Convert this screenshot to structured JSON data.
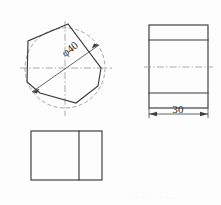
{
  "sheet": {
    "width": 221,
    "height": 205,
    "background": "#fdfdfd",
    "line_color": "#3a3a3a",
    "construction_color": "#8f8f8f"
  },
  "views": {
    "front_view": {
      "name": "front-view-polygon",
      "description": "heptagon inscribed in dashed construction circle",
      "center_x": 65,
      "center_y": 68,
      "circle_radius": 40,
      "polygon_sides": 7,
      "polygon_points": "68,24 28,41 27,82 40,93 76,103 98,86 101,68",
      "centerline_h": {
        "x1": 20,
        "y1": 68,
        "x2": 112,
        "y2": 68
      },
      "centerline_v": {
        "x1": 65,
        "y1": 21,
        "x2": 65,
        "y2": 116
      }
    },
    "side_view": {
      "name": "side-view-rectangle",
      "x": 149,
      "y": 25,
      "width": 59,
      "height": 83,
      "horizontal_lines_y": [
        40,
        93
      ],
      "centerline_y": 67
    },
    "top_view": {
      "name": "top-view-rectangle",
      "x": 31,
      "y": 131,
      "width": 71,
      "height": 49,
      "divider_x": 79
    }
  },
  "dimensions": [
    {
      "id": "diameter-dim",
      "label": "φ40",
      "value": 40,
      "symbol": "φ",
      "text_x": 72,
      "text_y": 52,
      "rotation": -38,
      "line": {
        "x1": 32,
        "y1": 92,
        "x2": 99,
        "y2": 45
      }
    },
    {
      "id": "width-dim",
      "label": "30",
      "value": 30,
      "text_x": 178,
      "text_y": 117,
      "line": {
        "x1": 149,
        "y1": 114,
        "x2": 208,
        "y2": 114
      }
    }
  ],
  "caption": {
    "text": "· · ···   ·· ···",
    "x": 128,
    "y": 200
  }
}
